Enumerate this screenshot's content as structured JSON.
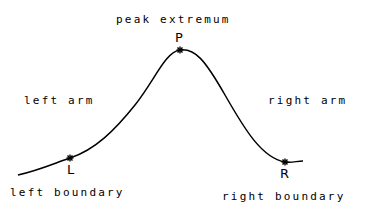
{
  "diagram": {
    "curve": {
      "description": "Single bell-shaped peak rising from left boundary to peak extremum and descending to right boundary",
      "color": "#000000"
    },
    "points": [
      {
        "id": "L",
        "letter": "L",
        "label": "left boundary"
      },
      {
        "id": "P",
        "letter": "P",
        "label": "peak extremum"
      },
      {
        "id": "R",
        "letter": "R",
        "label": "right boundary"
      }
    ],
    "region_labels": {
      "left": "left arm",
      "right": "right arm"
    },
    "marker_symbol": "*"
  }
}
